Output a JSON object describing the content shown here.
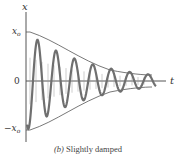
{
  "diagram": {
    "caption_prefix": "(b)",
    "caption_text": "Slightly damped",
    "axes": {
      "y_label": "x",
      "x_label": "t",
      "zero_label": "0",
      "pos_amp_label": "x",
      "pos_amp_sub": "o",
      "neg_amp_label": "−x",
      "neg_amp_sub": "o"
    },
    "colors": {
      "axis": "#555555",
      "envelope": "#555555",
      "wave": "#6f6f6f",
      "text": "#333333"
    },
    "curve": {
      "type": "damped_cosine",
      "cycles": 7,
      "amplitude_start": 1.0,
      "amplitude_end": 0.12
    }
  }
}
